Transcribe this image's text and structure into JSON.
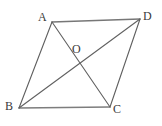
{
  "figure": {
    "kind": "parallelogram-with-diagonals",
    "background_color": "#ffffff",
    "stroke_color": "#6e6e6e",
    "stroke_color_dark": "#5a5a5a",
    "label_color": "#3a3a3a",
    "stroke_width": 1,
    "points": {
      "A": {
        "label": "A",
        "x": 52,
        "y": 22,
        "label_x": 38,
        "label_y": 11
      },
      "D": {
        "label": "D",
        "x": 140,
        "y": 19,
        "label_x": 143,
        "label_y": 10
      },
      "B": {
        "label": "B",
        "x": 19,
        "y": 108,
        "label_x": 5,
        "label_y": 100
      },
      "C": {
        "label": "C",
        "x": 110,
        "y": 107,
        "label_x": 113,
        "label_y": 103
      },
      "O": {
        "label": "O",
        "x": 80,
        "y": 62,
        "label_x": 72,
        "label_y": 43
      }
    },
    "edges": [
      {
        "name": "side-AD",
        "from": "A",
        "to": "D"
      },
      {
        "name": "side-DC",
        "from": "D",
        "to": "C"
      },
      {
        "name": "side-CB",
        "from": "C",
        "to": "B"
      },
      {
        "name": "side-BA",
        "from": "B",
        "to": "A"
      },
      {
        "name": "diagonal-AC",
        "from": "A",
        "to": "C"
      },
      {
        "name": "diagonal-BD",
        "from": "B",
        "to": "D"
      }
    ]
  }
}
